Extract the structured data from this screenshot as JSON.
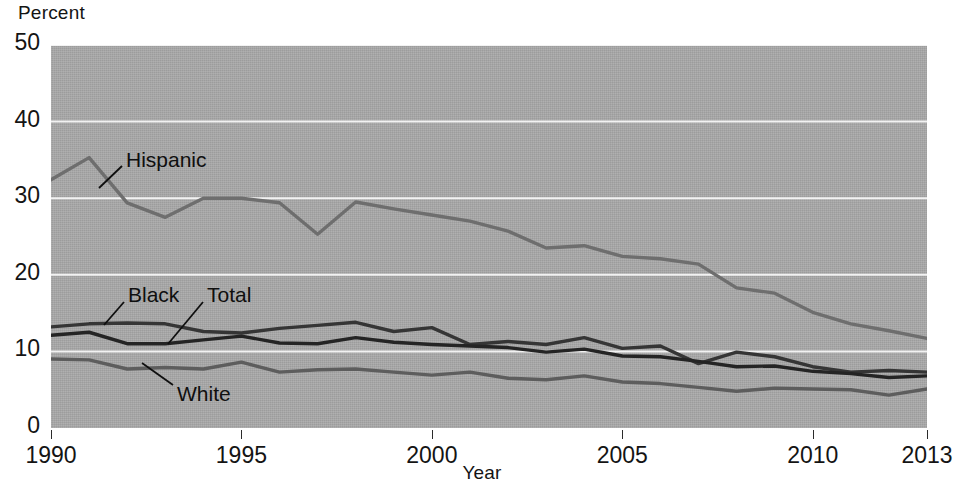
{
  "chart_data": {
    "type": "line",
    "title": "",
    "xlabel": "Year",
    "ylabel": "Percent",
    "ylim": [
      0,
      50
    ],
    "xlim": [
      1990,
      2013
    ],
    "ytick_labels": [
      "0",
      "10",
      "20",
      "30",
      "40",
      "50"
    ],
    "yticks": [
      0,
      10,
      20,
      30,
      40,
      50
    ],
    "xtick_labels": [
      "1990",
      "1995",
      "2000",
      "2005",
      "2010",
      "2013"
    ],
    "xticks": [
      1990,
      1995,
      2000,
      2005,
      2010,
      2013
    ],
    "grid": "horizontal",
    "legend_position": "inline-leader-labels",
    "x": [
      1990,
      1991,
      1992,
      1993,
      1994,
      1995,
      1996,
      1997,
      1998,
      1999,
      2000,
      2001,
      2002,
      2003,
      2004,
      2005,
      2006,
      2007,
      2008,
      2009,
      2010,
      2011,
      2012,
      2013
    ],
    "series": [
      {
        "name": "Hispanic",
        "color": "#6e6e6e",
        "values": [
          32.4,
          35.3,
          29.4,
          27.5,
          30.0,
          30.0,
          29.4,
          25.3,
          29.5,
          28.6,
          27.8,
          27.0,
          25.7,
          23.5,
          23.8,
          22.4,
          22.1,
          21.4,
          18.3,
          17.6,
          15.1,
          13.6,
          12.7,
          11.7
        ]
      },
      {
        "name": "Black",
        "color": "#353535",
        "values": [
          13.2,
          13.6,
          13.7,
          13.6,
          12.6,
          12.4,
          13.0,
          13.4,
          13.8,
          12.6,
          13.1,
          10.9,
          11.3,
          10.9,
          11.8,
          10.4,
          10.7,
          8.4,
          9.9,
          9.3,
          8.0,
          7.3,
          7.5,
          7.3
        ]
      },
      {
        "name": "Total",
        "color": "#242424",
        "values": [
          12.1,
          12.5,
          11.0,
          11.0,
          11.5,
          12.0,
          11.1,
          11.0,
          11.8,
          11.2,
          10.9,
          10.7,
          10.5,
          9.9,
          10.3,
          9.4,
          9.3,
          8.7,
          8.0,
          8.1,
          7.4,
          7.1,
          6.6,
          6.8
        ]
      },
      {
        "name": "White",
        "color": "#5d5d5d",
        "values": [
          9.0,
          8.9,
          7.7,
          7.9,
          7.7,
          8.6,
          7.3,
          7.6,
          7.7,
          7.3,
          6.9,
          7.3,
          6.5,
          6.3,
          6.8,
          6.0,
          5.8,
          5.3,
          4.8,
          5.2,
          5.1,
          5.0,
          4.3,
          5.1
        ]
      }
    ],
    "annotations": [
      {
        "text": "Hispanic",
        "label_x": 126,
        "label_y": 148,
        "leader": [
          [
            122,
            166
          ],
          [
            99,
            188
          ]
        ]
      },
      {
        "text": "Black",
        "label_x": 128,
        "label_y": 283,
        "leader": [
          [
            124,
            302
          ],
          [
            104,
            325
          ]
        ]
      },
      {
        "text": "Total",
        "label_x": 207,
        "label_y": 283,
        "leader": [
          [
            203,
            302
          ],
          [
            168,
            344
          ]
        ]
      },
      {
        "text": "White",
        "label_x": 177,
        "label_y": 382,
        "leader": [
          [
            173,
            385
          ],
          [
            142,
            363
          ]
        ]
      }
    ]
  },
  "labels": {
    "percent": "Percent",
    "year": "Year"
  }
}
